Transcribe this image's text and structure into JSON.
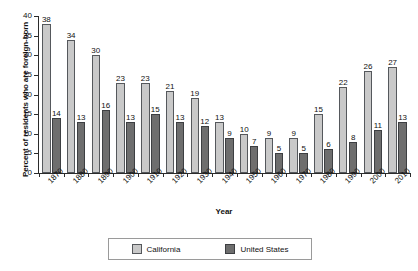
{
  "chart_data": {
    "type": "bar",
    "title": "",
    "xlabel": "Year",
    "ylabel": "Percent of residents who are foreign-born",
    "ylim": [
      0,
      40
    ],
    "yticks": [
      0,
      5,
      10,
      15,
      20,
      25,
      30,
      35,
      40
    ],
    "grid": false,
    "legend_position": "bottom",
    "categories": [
      "1870",
      "1880",
      "1890",
      "1900",
      "1910",
      "1920",
      "1930",
      "1940",
      "1950",
      "1960",
      "1970",
      "1980",
      "1990",
      "2000",
      "2010"
    ],
    "series": [
      {
        "name": "California",
        "color": "#c9c9c9",
        "values": [
          38,
          34,
          30,
          23,
          23,
          21,
          19,
          13,
          10,
          9,
          9,
          15,
          22,
          26,
          27
        ]
      },
      {
        "name": "United States",
        "color": "#6e6e6e",
        "values": [
          14,
          13,
          16,
          13,
          15,
          13,
          12,
          9,
          7,
          5,
          5,
          6,
          8,
          11,
          13
        ]
      }
    ]
  },
  "legend": {
    "items": [
      {
        "label": "California",
        "swatch": "legend-swatch-california"
      },
      {
        "label": "United States",
        "swatch": "legend-swatch-united-states"
      }
    ]
  }
}
